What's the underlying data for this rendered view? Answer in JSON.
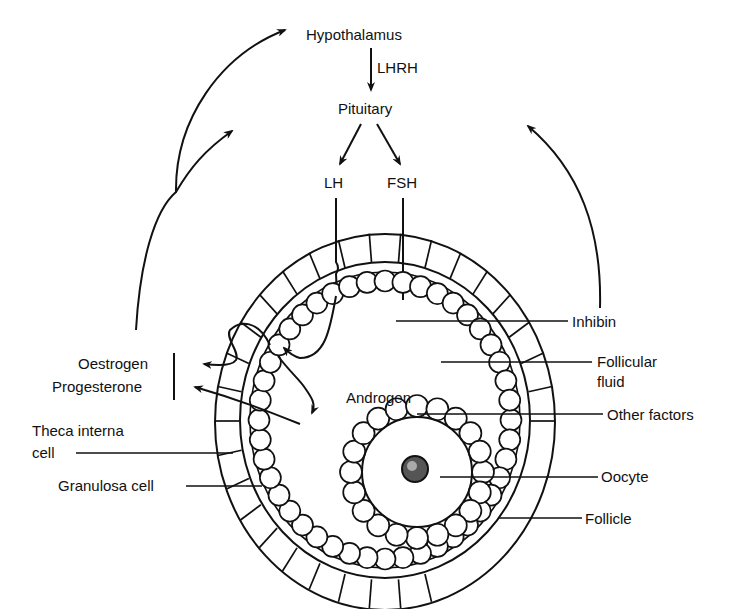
{
  "diagram": {
    "type": "endocrine-feedback-diagram",
    "colors": {
      "ink": "#111111",
      "background": "#ffffff"
    },
    "nodes": {
      "hypothalamus": "Hypothalamus",
      "lhrh": "LHRH",
      "pituitary": "Pituitary",
      "lh": "LH",
      "fsh": "FSH",
      "androgen": "Androgen"
    },
    "left_labels": {
      "oestrogen": "Oestrogen",
      "progesterone": "Progesterone",
      "theca_line1": "Theca interna",
      "theca_line2": "cell",
      "granulosa": "Granulosa cell"
    },
    "right_labels": {
      "inhibin": "Inhibin",
      "follicular_line1": "Follicular",
      "follicular_line2": "fluid",
      "other_factors": "Other factors",
      "oocyte": "Oocyte",
      "follicle": "Follicle"
    },
    "edges": [
      {
        "from": "Hypothalamus",
        "to": "Pituitary",
        "label": "LHRH"
      },
      {
        "from": "Pituitary",
        "to": "LH"
      },
      {
        "from": "Pituitary",
        "to": "FSH"
      },
      {
        "from": "LH",
        "to": "Theca interna cell"
      },
      {
        "from": "FSH",
        "to": "Granulosa cell"
      },
      {
        "from": "Theca interna cell",
        "to": "Androgen"
      },
      {
        "from": "Androgen",
        "to": "Granulosa cell"
      },
      {
        "from": "Follicle",
        "to": "Oestrogen / Progesterone"
      },
      {
        "from": "Oestrogen / Progesterone",
        "to": "Hypothalamus",
        "type": "feedback"
      },
      {
        "from": "Oestrogen / Progesterone",
        "to": "Pituitary",
        "type": "feedback"
      },
      {
        "from": "Inhibin",
        "to": "Pituitary",
        "type": "feedback"
      }
    ]
  }
}
